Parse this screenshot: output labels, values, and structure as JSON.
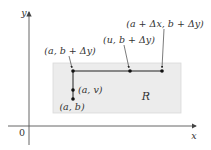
{
  "diagram": {
    "axes": {
      "x_label": "x",
      "y_label": "y",
      "origin_label": "0"
    },
    "region": {
      "label": "R",
      "fill": "#ececec",
      "stroke": "#d6d6d6"
    },
    "points": [
      {
        "id": "a-b-plus-dy",
        "label": "(a, b + Δy)"
      },
      {
        "id": "u-b-plus-dy",
        "label": "(u, b + Δy)"
      },
      {
        "id": "a-plus-dx-b-plus-dy",
        "label": "(a + Δx, b + Δy)"
      },
      {
        "id": "a-v",
        "label": "(a, v)"
      },
      {
        "id": "a-b",
        "label": "(a, b)"
      }
    ],
    "colors": {
      "ink": "#222222",
      "axis": "#555555"
    }
  }
}
